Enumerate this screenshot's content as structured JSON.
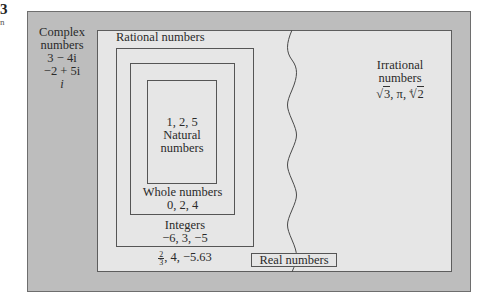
{
  "figure": {
    "label_fragment": "3",
    "sub_fragment": "n"
  },
  "complex": {
    "title_line1": "Complex",
    "title_line2": "numbers",
    "examples": [
      "3 − 4i",
      "−2 + 5i",
      "i"
    ]
  },
  "rational": {
    "title": "Rational numbers",
    "example_fraction": {
      "numerator": "2",
      "denominator": "3"
    },
    "examples_rest": ", 4, −5.63"
  },
  "integers": {
    "title": "Integers",
    "examples": "−6, 3, −5"
  },
  "whole": {
    "title": "Whole numbers",
    "examples": "0, 2, 4"
  },
  "natural": {
    "examples": "1, 2, 5",
    "title_line1": "Natural",
    "title_line2": "numbers"
  },
  "irrational": {
    "title_line1": "Irrational",
    "title_line2": "numbers",
    "examples": {
      "sqrt3": "3",
      "pi": "π",
      "root4_index": "4",
      "root4_radicand": "2"
    }
  },
  "real": {
    "title": "Real numbers"
  },
  "colors": {
    "complex_bg": "#bdbdbd",
    "real_bg": "#e6e6e6",
    "border": "#555555"
  }
}
